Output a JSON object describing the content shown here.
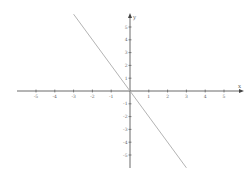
{
  "chart_data": {
    "type": "line",
    "title": "",
    "xlabel": "x",
    "ylabel": "y",
    "xlim": [
      -6,
      6
    ],
    "ylim": [
      -6,
      6
    ],
    "grid": false,
    "legend": null,
    "x_ticks": [
      -5,
      -4,
      -3,
      -2,
      -1,
      1,
      2,
      3,
      4,
      5
    ],
    "y_ticks": [
      -5,
      -4,
      -3,
      -2,
      -1,
      1,
      2,
      3,
      4,
      5
    ],
    "x_tick_labels": [
      "-5",
      "-4",
      "-3",
      "-2",
      "-1",
      "1",
      "2",
      "3",
      "4",
      "5"
    ],
    "y_tick_labels": [
      "-5",
      "-4",
      "-3",
      "-2",
      "-1",
      "1",
      "2",
      "3",
      "4",
      "5"
    ],
    "series": [
      {
        "name": "y = -2x",
        "x": [
          -3,
          3
        ],
        "y": [
          6,
          -6
        ],
        "color": "#aaaaaa"
      }
    ]
  },
  "style": {
    "axis_color": "#444444",
    "line_color": "#aaaaaa",
    "background": "#ffffff"
  }
}
